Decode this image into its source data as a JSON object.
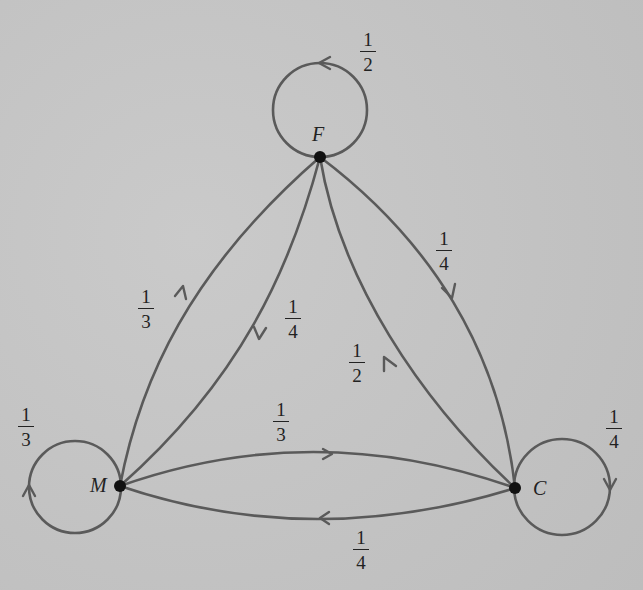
{
  "diagram": {
    "type": "markov-chain-state-diagram",
    "nodes": {
      "F": {
        "label": "F"
      },
      "M": {
        "label": "M"
      },
      "C": {
        "label": "C"
      }
    },
    "edges": {
      "F_F": {
        "from": "F",
        "to": "F",
        "num": "1",
        "den": "2"
      },
      "M_M": {
        "from": "M",
        "to": "M",
        "num": "1",
        "den": "3"
      },
      "C_C": {
        "from": "C",
        "to": "C",
        "num": "1",
        "den": "4"
      },
      "M_F": {
        "from": "M",
        "to": "F",
        "num": "1",
        "den": "3"
      },
      "F_M": {
        "from": "F",
        "to": "M",
        "num": "1",
        "den": "4"
      },
      "C_F": {
        "from": "C",
        "to": "F",
        "num": "1",
        "den": "2"
      },
      "F_C": {
        "from": "F",
        "to": "C",
        "num": "1",
        "den": "4"
      },
      "M_C": {
        "from": "M",
        "to": "C",
        "num": "1",
        "den": "3"
      },
      "C_M": {
        "from": "C",
        "to": "M",
        "num": "1",
        "den": "4"
      }
    },
    "colors": {
      "edge": "#5a5a5a",
      "node": "#111111",
      "background": "#c4c4c4"
    }
  }
}
